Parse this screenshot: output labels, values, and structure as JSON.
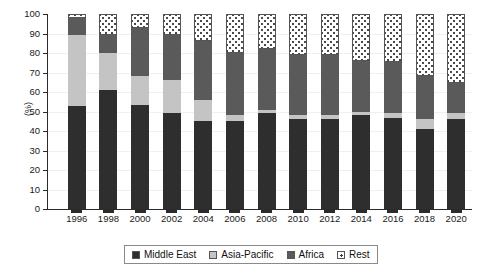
{
  "chart_data": {
    "type": "bar",
    "stacked": true,
    "title": "",
    "xlabel": "",
    "ylabel": "(%)",
    "ylim": [
      0,
      100
    ],
    "yticks": [
      0,
      10,
      20,
      30,
      40,
      50,
      60,
      70,
      80,
      90,
      100
    ],
    "grid": false,
    "legend_position": "bottom",
    "categories": [
      "1996",
      "1998",
      "2000",
      "2002",
      "2004",
      "2006",
      "2008",
      "2010",
      "2012",
      "2014",
      "2016",
      "2018",
      "2020"
    ],
    "series": [
      {
        "name": "Middle East",
        "color": "#2e2e2e",
        "pattern": "solid-dark",
        "values": [
          53,
          61,
          53.5,
          49,
          45,
          45,
          49,
          46,
          46,
          48,
          46.5,
          41,
          46
        ]
      },
      {
        "name": "Asia-Pacific",
        "color": "#c4c4c4",
        "pattern": "solid-light-gray",
        "values": [
          36,
          19,
          14.5,
          17,
          11,
          3,
          2,
          2,
          2,
          2,
          2.5,
          5,
          3
        ]
      },
      {
        "name": "Africa",
        "color": "#5a5a5a",
        "pattern": "solid-medium-gray",
        "values": [
          9,
          9,
          25,
          23,
          30,
          32,
          31,
          31,
          31,
          26,
          26.5,
          22,
          15.5
        ]
      },
      {
        "name": "Rest",
        "color": "#ffffff",
        "pattern": "dotted",
        "values": [
          2,
          11,
          7,
          11,
          14,
          20,
          18,
          21,
          21,
          24,
          24.5,
          32,
          35.5
        ]
      }
    ],
    "cumulative_tops": {
      "1996": [
        53,
        89,
        98,
        100
      ],
      "1998": [
        61,
        80,
        89,
        100
      ],
      "2000": [
        53.5,
        68,
        93,
        100
      ],
      "2002": [
        49,
        66,
        89,
        100
      ],
      "2004": [
        45,
        56,
        86,
        100
      ],
      "2006": [
        45,
        48,
        80,
        100
      ],
      "2008": [
        49,
        51,
        82,
        100
      ],
      "2010": [
        46,
        48,
        79,
        100
      ],
      "2012": [
        46,
        48,
        79,
        100
      ],
      "2014": [
        48,
        50,
        76,
        100
      ],
      "2016": [
        46.5,
        49,
        75.5,
        100
      ],
      "2018": [
        41,
        46,
        68,
        100
      ],
      "2020": [
        46,
        49,
        64.5,
        100
      ]
    }
  },
  "axis": {
    "ylabel": "(%)",
    "yticks": [
      "0",
      "10",
      "20",
      "30",
      "40",
      "50",
      "60",
      "70",
      "80",
      "90",
      "100"
    ],
    "xticks": [
      "1996",
      "1998",
      "2000",
      "2002",
      "2004",
      "2006",
      "2008",
      "2010",
      "2012",
      "2014",
      "2016",
      "2018",
      "2020"
    ]
  },
  "legend": {
    "items": [
      {
        "label": "Middle East"
      },
      {
        "label": "Asia-Pacific"
      },
      {
        "label": "Africa"
      },
      {
        "label": "Rest"
      }
    ]
  }
}
